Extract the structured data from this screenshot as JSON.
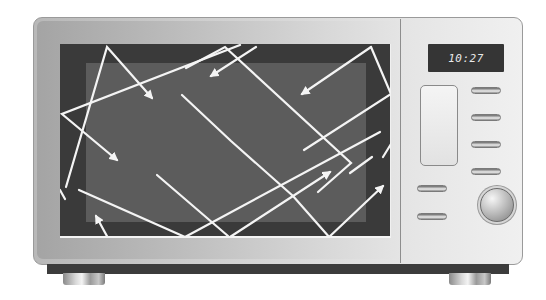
{
  "scene": {
    "subject": "Microwave oven illustration with microwave reflection arrows",
    "colors": {
      "body": "#d0d0d0",
      "window_outer": "#3a3a3a",
      "window_inner": "#5c5c5c",
      "wave_lines": "#f4f4f4",
      "display_bg": "#353535",
      "display_text": "#e8e8e8"
    }
  },
  "panel": {
    "display_time": "10:27",
    "buttons_right_column": 5,
    "buttons_left_column": 2,
    "knob": "round dial"
  },
  "window": {
    "wave_paths": [
      "M 32 233 L 59 113 L 69 69 L 40 59",
      "M 33 128 L 155 178",
      "M 47 110 L 0 61 ",
      "M 59 113 L 209 56",
      "M 60 70 L 0 137"
    ]
  }
}
